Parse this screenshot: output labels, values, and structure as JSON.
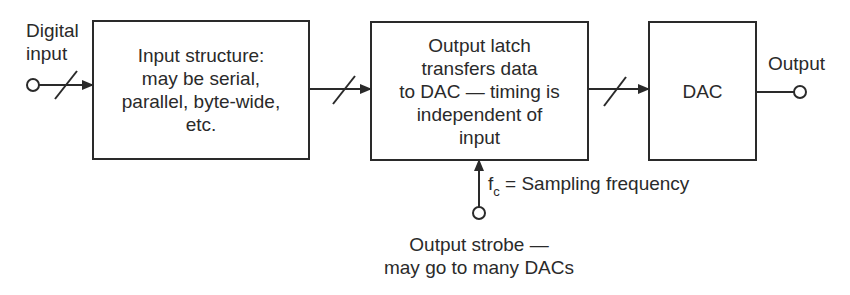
{
  "diagram": {
    "type": "block-diagram",
    "colors": {
      "line": "#2a2a2a",
      "background": "#ffffff"
    },
    "nodes": [
      {
        "id": "digital-input",
        "shape": "terminal-circle",
        "label_lines": [
          "Digital",
          "input"
        ]
      },
      {
        "id": "input-structure",
        "shape": "box",
        "label_lines": [
          "Input structure:",
          "may be serial,",
          "parallel, byte-wide,",
          "etc."
        ]
      },
      {
        "id": "output-latch",
        "shape": "box",
        "label_lines": [
          "Output latch",
          "transfers data",
          "to DAC — timing is",
          "independent of",
          "input"
        ]
      },
      {
        "id": "dac",
        "shape": "box",
        "label_lines": [
          "DAC"
        ]
      },
      {
        "id": "output",
        "shape": "terminal-circle",
        "label_lines": [
          "Output"
        ]
      },
      {
        "id": "output-strobe",
        "shape": "terminal-circle",
        "label_lines": [
          "Output strobe —",
          "may go to many DACs"
        ]
      }
    ],
    "edges": [
      {
        "from": "digital-input",
        "to": "input-structure",
        "bus": true
      },
      {
        "from": "input-structure",
        "to": "output-latch",
        "bus": true
      },
      {
        "from": "output-latch",
        "to": "dac",
        "bus": true
      },
      {
        "from": "dac",
        "to": "output",
        "bus": false
      },
      {
        "from": "output-strobe",
        "to": "output-latch",
        "bus": false,
        "label": "fc = Sampling frequency"
      }
    ]
  },
  "labels": {
    "digital_input_1": "Digital",
    "digital_input_2": "input",
    "input_structure": [
      "Input structure:",
      "may be serial,",
      "parallel, byte-wide,",
      "etc."
    ],
    "output_latch": [
      "Output latch",
      "transfers data",
      "to DAC — timing is",
      "independent of",
      "input"
    ],
    "dac": "DAC",
    "output": "Output",
    "fc_symbol": "f",
    "fc_subscript": "c",
    "fc_text": " = Sampling frequency",
    "strobe_1": "Output strobe —",
    "strobe_2": "may go to many DACs"
  }
}
